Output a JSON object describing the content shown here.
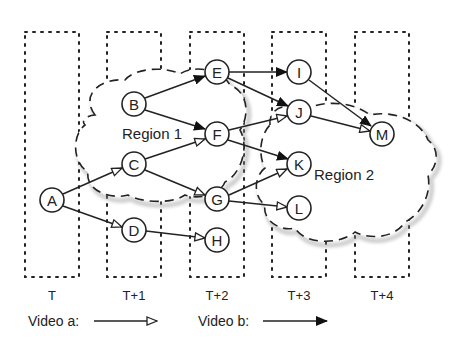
{
  "diagram": {
    "time_columns": [
      {
        "label": "T",
        "x": 52
      },
      {
        "label": "T+1",
        "x": 134
      },
      {
        "label": "T+2",
        "x": 217
      },
      {
        "label": "T+3",
        "x": 299
      },
      {
        "label": "T+4",
        "x": 382
      }
    ],
    "regions": [
      {
        "label": "Region 1"
      },
      {
        "label": "Region 2"
      }
    ],
    "nodes": [
      {
        "id": "A",
        "label": "A",
        "time": "T"
      },
      {
        "id": "B",
        "label": "B",
        "time": "T+1"
      },
      {
        "id": "C",
        "label": "C",
        "time": "T+1"
      },
      {
        "id": "D",
        "label": "D",
        "time": "T+1"
      },
      {
        "id": "E",
        "label": "E",
        "time": "T+2"
      },
      {
        "id": "F",
        "label": "F",
        "time": "T+2"
      },
      {
        "id": "G",
        "label": "G",
        "time": "T+2"
      },
      {
        "id": "H",
        "label": "H",
        "time": "T+2"
      },
      {
        "id": "I",
        "label": "I",
        "time": "T+3"
      },
      {
        "id": "J",
        "label": "J",
        "time": "T+3"
      },
      {
        "id": "K",
        "label": "K",
        "time": "T+3"
      },
      {
        "id": "L",
        "label": "L",
        "time": "T+3"
      },
      {
        "id": "M",
        "label": "M",
        "time": "T+4"
      }
    ],
    "edges": [
      {
        "from": "A",
        "to": "C",
        "video": "a"
      },
      {
        "from": "A",
        "to": "D",
        "video": "a"
      },
      {
        "from": "B",
        "to": "E",
        "video": "b"
      },
      {
        "from": "B",
        "to": "F",
        "video": "b"
      },
      {
        "from": "C",
        "to": "F",
        "video": "a"
      },
      {
        "from": "C",
        "to": "G",
        "video": "a"
      },
      {
        "from": "D",
        "to": "H",
        "video": "a"
      },
      {
        "from": "E",
        "to": "I",
        "video": "b"
      },
      {
        "from": "E",
        "to": "J",
        "video": "b"
      },
      {
        "from": "F",
        "to": "J",
        "video": "a"
      },
      {
        "from": "F",
        "to": "K",
        "video": "b"
      },
      {
        "from": "G",
        "to": "K",
        "video": "a"
      },
      {
        "from": "G",
        "to": "L",
        "video": "a"
      },
      {
        "from": "I",
        "to": "M",
        "video": "b"
      },
      {
        "from": "J",
        "to": "M",
        "video": "a"
      }
    ],
    "legend": {
      "video_a": {
        "label": "Video a:",
        "arrow": "hollow-arrow"
      },
      "video_b": {
        "label": "Video b:",
        "arrow": "filled-arrow"
      }
    }
  }
}
